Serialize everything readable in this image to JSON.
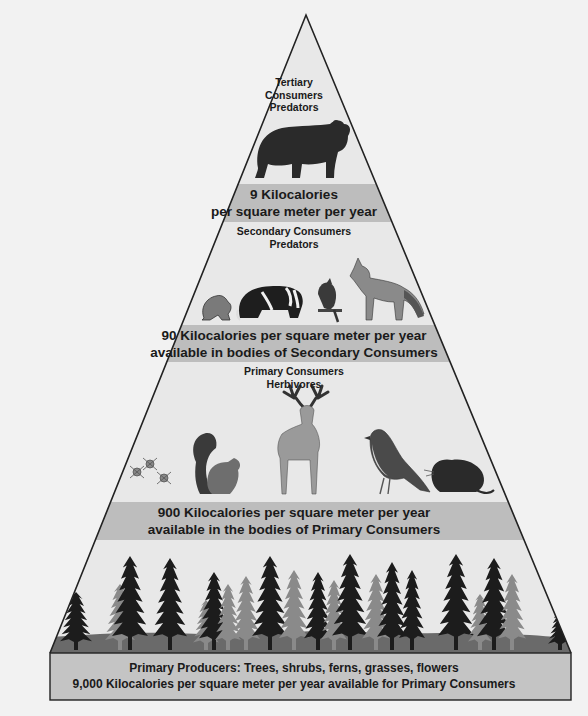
{
  "diagram": {
    "type": "energy-pyramid",
    "colors": {
      "background": "#f2f2f2",
      "pyramid_fill": "#e8e8e8",
      "band_fill": "#bdbdbd",
      "base_fill": "#c4c4c4",
      "outline": "#222222",
      "ground": "#6a6a6a"
    },
    "levels": [
      {
        "id": "tertiary",
        "title_lines": [
          "Tertiary",
          "Consumers",
          "Predators"
        ],
        "organisms": [
          "bear"
        ],
        "energy_lines": [
          "9 Kilocalories",
          "per square meter per year"
        ]
      },
      {
        "id": "secondary",
        "title_lines": [
          "Secondary Consumers",
          "Predators"
        ],
        "organisms": [
          "frog",
          "badger",
          "bird",
          "fox"
        ],
        "energy_lines": [
          "90 Kilocalories per square meter per year",
          "available in bodies of Secondary Consumers"
        ]
      },
      {
        "id": "primary",
        "title_lines": [
          "Primary Consumers",
          "Herbivores"
        ],
        "organisms": [
          "insects",
          "squirrel",
          "deer",
          "songbird",
          "vole"
        ],
        "energy_lines": [
          "900 Kilocalories per square meter per year",
          "available in the bodies of Primary Consumers"
        ]
      },
      {
        "id": "producers",
        "organisms": [
          "conifer-trees"
        ],
        "energy_lines": [
          "Primary Producers: Trees, shrubs, ferns, grasses, flowers",
          "9,000 Kilocalories per square meter per year available for Primary Consumers"
        ]
      }
    ]
  }
}
